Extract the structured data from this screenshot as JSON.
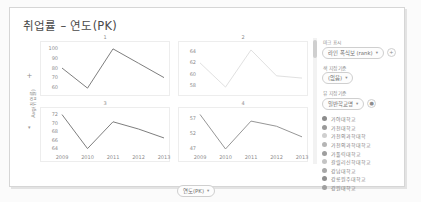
{
  "card": {
    "title": "취업률 – 연도(PK)",
    "y_axis_title": "Avg(취업률)",
    "x_axis_pill": "연도(PK)",
    "pill_caret": "▾",
    "plus_icon": "+",
    "caret_icon": "▾"
  },
  "controls": {
    "mark_label": "마크 표시",
    "mark_value": "라인 폭식보 (rank)",
    "color_label": "색 지정 기준",
    "color_value": "(없음)",
    "detail_label": "뷰 지정 기준",
    "detail_value": "일반학교명",
    "add_icon": "+",
    "more_icon": "●"
  },
  "legend": {
    "items": [
      {
        "label": "가야대학교",
        "color": "#8c8c8c"
      },
      {
        "label": "가천대학교",
        "color": "#9a9a9a"
      },
      {
        "label": "가천의과학대학",
        "color": "#cfcfcf"
      },
      {
        "label": "가천의과학대학교",
        "color": "#b5b5b5"
      },
      {
        "label": "가톨릭대학교",
        "color": "#9e9e9e"
      },
      {
        "label": "갈릴리신학대학교",
        "color": "#c4c4c4"
      },
      {
        "label": "강남대학교",
        "color": "#a8a8a8"
      },
      {
        "label": "강릉원주대학교",
        "color": "#8f8f8f"
      },
      {
        "label": "강원대학교",
        "color": "#a0a0a0"
      }
    ]
  },
  "chart_data": [
    {
      "type": "line",
      "title": "1",
      "x": [
        "2009",
        "2010",
        "2011",
        "2012",
        "2013"
      ],
      "values": [
        80,
        59,
        100,
        85,
        70
      ],
      "ticks": [
        100,
        90,
        80,
        70,
        60
      ],
      "ylim": [
        56,
        103
      ],
      "color": "#6f6f6f",
      "xlabel": "연도(PK)",
      "ylabel": "Avg(취업률)"
    },
    {
      "type": "line",
      "title": "2",
      "x": [
        "2009",
        "2010",
        "2011",
        "2012",
        "2013"
      ],
      "values": [
        62,
        57.7,
        64.3,
        59.7,
        59.3
      ],
      "ticks": [
        64,
        62,
        60,
        58
      ],
      "ylim": [
        57,
        65
      ],
      "color": "#dcdcdc",
      "xlabel": "연도(PK)",
      "ylabel": "Avg(취업률)"
    },
    {
      "type": "line",
      "title": "3",
      "x": [
        "2009",
        "2010",
        "2011",
        "2012",
        "2013"
      ],
      "values": [
        72,
        64,
        70.3,
        68.6,
        66.5
      ],
      "ticks": [
        72,
        70,
        68,
        66,
        64
      ],
      "ylim": [
        63.2,
        72.6
      ],
      "color": "#6f6f6f",
      "xlabel": "연도(PK)",
      "ylabel": "Avg(취업률)"
    },
    {
      "type": "line",
      "title": "4",
      "x": [
        "2009",
        "2010",
        "2011",
        "2012",
        "2013"
      ],
      "values": [
        58.4,
        47,
        56.2,
        54.5,
        51
      ],
      "ticks": [
        57,
        52,
        47
      ],
      "ylim": [
        46,
        59.2
      ],
      "color": "#8a8a8a",
      "xlabel": "연도(PK)",
      "ylabel": "Avg(취업률)"
    }
  ]
}
